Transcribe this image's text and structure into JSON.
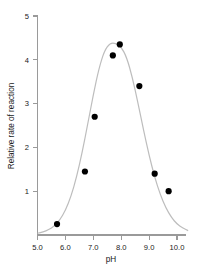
{
  "chart_data": {
    "type": "scatter",
    "title": "",
    "subtitle": "",
    "xlabel": "pH",
    "ylabel": "Relative rate of reaction",
    "xlim": [
      5.0,
      10.4
    ],
    "ylim": [
      0,
      5
    ],
    "xticks": [
      "5.0",
      "6.0",
      "7.0",
      "8.0",
      "9.0",
      "10.0"
    ],
    "xtick_values": [
      5.0,
      6.0,
      7.0,
      8.0,
      9.0,
      10.0
    ],
    "yticks": [
      "1",
      "2",
      "3",
      "4",
      "5"
    ],
    "ytick_values": [
      1,
      2,
      3,
      4,
      5
    ],
    "grid": false,
    "legend": "none",
    "series": [
      {
        "name": "Relative rate of reaction",
        "marker": "filled-circle",
        "marker_color": "#000000",
        "x": [
          5.7,
          6.7,
          7.05,
          7.7,
          7.95,
          8.65,
          9.2,
          9.7
        ],
        "values": [
          0.25,
          1.45,
          2.7,
          4.1,
          4.35,
          3.4,
          1.4,
          1.0
        ]
      },
      {
        "name": "fitted bell curve",
        "type": "line",
        "line_color": "#bdbdbd",
        "x": [
          5.0,
          5.2,
          5.4,
          5.6,
          5.8,
          6.0,
          6.2,
          6.4,
          6.6,
          6.8,
          7.0,
          7.2,
          7.4,
          7.6,
          7.8,
          8.0,
          8.2,
          8.4,
          8.6,
          8.8,
          9.0,
          9.2,
          9.4,
          9.6,
          9.8,
          10.0,
          10.2,
          10.4
        ],
        "values": [
          0.04,
          0.07,
          0.12,
          0.2,
          0.34,
          0.56,
          0.88,
          1.32,
          1.88,
          2.53,
          3.2,
          3.8,
          4.21,
          4.38,
          4.38,
          4.3,
          4.05,
          3.6,
          3.02,
          2.4,
          1.82,
          1.32,
          0.92,
          0.62,
          0.4,
          0.25,
          0.16,
          0.1
        ]
      }
    ]
  },
  "axes": {
    "x_axis_label": "pH",
    "y_axis_label": "Relative rate of reaction"
  }
}
